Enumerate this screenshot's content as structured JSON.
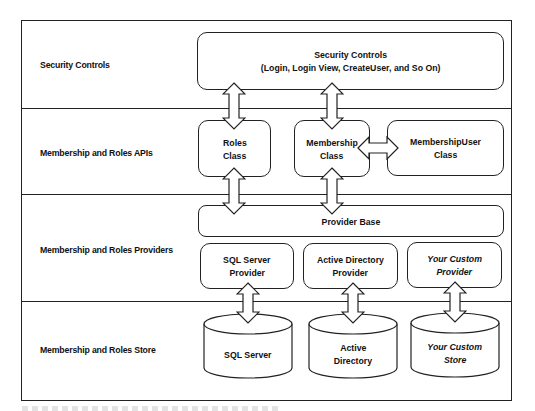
{
  "diagram": {
    "type": "layered-architecture",
    "rows": [
      {
        "label": "Security Controls"
      },
      {
        "label": "Membership and Roles APIs"
      },
      {
        "label": "Membership and Roles Providers"
      },
      {
        "label": "Membership and Roles Store"
      }
    ],
    "security_controls": {
      "line1": "Security Controls",
      "line2": "(Login, Login View, CreateUser, and So On)"
    },
    "apis": {
      "roles": {
        "line1": "Roles",
        "line2": "Class"
      },
      "membership": {
        "line1": "Membership",
        "line2": "Class"
      },
      "membership_user": {
        "line1": "MembershipUser",
        "line2": "Class"
      }
    },
    "provider_base": {
      "label": "Provider Base"
    },
    "providers": [
      {
        "line1": "SQL Server",
        "line2": "Provider",
        "italic": false
      },
      {
        "line1": "Active Directory",
        "line2": "Provider",
        "italic": false
      },
      {
        "line1": "Your Custom",
        "line2": "Provider",
        "italic": true
      }
    ],
    "stores": [
      {
        "line1": "SQL Server",
        "line2": "",
        "italic": false
      },
      {
        "line1": "Active",
        "line2": "Directory",
        "italic": false
      },
      {
        "line1": "Your Custom",
        "line2": "Store",
        "italic": true
      }
    ],
    "connections": [
      {
        "from": "Security Controls",
        "to": "Roles Class",
        "style": "double-arrow"
      },
      {
        "from": "Security Controls",
        "to": "Membership Class",
        "style": "double-arrow"
      },
      {
        "from": "Membership Class",
        "to": "MembershipUser Class",
        "style": "double-arrow"
      },
      {
        "from": "Roles Class",
        "to": "Provider Base",
        "style": "double-arrow"
      },
      {
        "from": "Membership Class",
        "to": "Provider Base",
        "style": "double-arrow"
      },
      {
        "from": "SQL Server Provider",
        "to": "SQL Server",
        "style": "double-arrow"
      },
      {
        "from": "Active Directory Provider",
        "to": "Active Directory",
        "style": "double-arrow"
      },
      {
        "from": "Your Custom Provider",
        "to": "Your Custom Store",
        "style": "double-arrow"
      }
    ],
    "colors": {
      "stroke": "#222222",
      "fill": "#ffffff",
      "text": "#111111"
    }
  }
}
